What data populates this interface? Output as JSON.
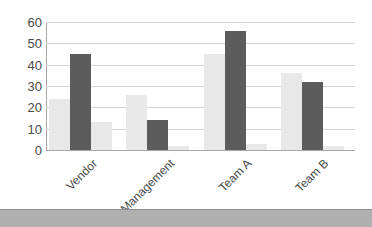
{
  "chart_data": {
    "type": "bar",
    "title": "",
    "subtitle": "",
    "xlabel": "",
    "ylabel": "",
    "categories": [
      "Vendor",
      "Management",
      "Team A",
      "Team B"
    ],
    "series": [
      {
        "name": "Series 1",
        "color": "#e8e8e8",
        "values": [
          24,
          26,
          45,
          36
        ]
      },
      {
        "name": "Series 2",
        "color": "#5c5c5c",
        "values": [
          45,
          14,
          56,
          32
        ]
      },
      {
        "name": "Series 3",
        "color": "#e8e8e8",
        "values": [
          13,
          2,
          3,
          2
        ]
      }
    ],
    "ylim": [
      0,
      60
    ],
    "yticks": [
      0,
      10,
      20,
      30,
      40,
      50,
      60
    ],
    "ytick_labels": [
      "0",
      "10",
      "20",
      "30",
      "40",
      "50",
      "60"
    ],
    "grid": true,
    "grid_axis": "y",
    "legend": false,
    "legend_position": "none",
    "xtick_rotation": -45,
    "annotations": []
  },
  "colors": {
    "background": "#ffffff",
    "grid": "#d4d4d4",
    "axis": "#a8a8a8",
    "tick_text": "#4a4a4a",
    "series_light": "#e8e8e8",
    "series_dark": "#5c5c5c",
    "footer_band": "#b0b0b0"
  }
}
